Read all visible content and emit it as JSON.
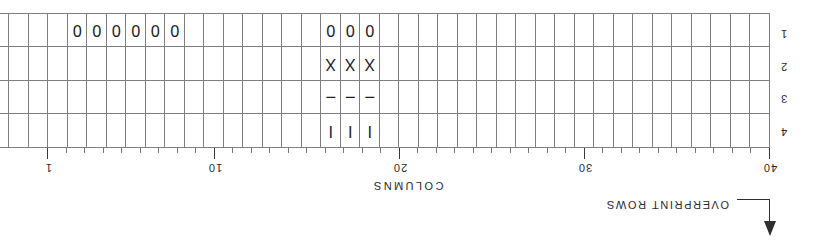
{
  "figure": {
    "orientation": "rotated-180",
    "columns_caption": "COLUMNS",
    "overprint_label": "OVERPRINT ROWS"
  },
  "grid": {
    "num_columns": 40,
    "num_rows": 4,
    "column_numbering_direction": "right-to-left",
    "row_labels": [
      "4",
      "3",
      "2",
      "1"
    ],
    "tick_labels": [
      {
        "value": "40",
        "column": 40
      },
      {
        "value": "30",
        "column": 30
      },
      {
        "value": "20",
        "column": 20
      },
      {
        "value": "10",
        "column": 10
      },
      {
        "value": "1",
        "column": 1
      }
    ],
    "marks": [
      {
        "row": 4,
        "column": 20,
        "char": "I"
      },
      {
        "row": 4,
        "column": 19,
        "char": "I"
      },
      {
        "row": 4,
        "column": 18,
        "char": "I"
      },
      {
        "row": 3,
        "column": 20,
        "char": "–"
      },
      {
        "row": 3,
        "column": 19,
        "char": "–"
      },
      {
        "row": 3,
        "column": 18,
        "char": "–"
      },
      {
        "row": 2,
        "column": 20,
        "char": "X"
      },
      {
        "row": 2,
        "column": 19,
        "char": "X"
      },
      {
        "row": 2,
        "column": 18,
        "char": "X"
      },
      {
        "row": 1,
        "column": 20,
        "char": "0"
      },
      {
        "row": 1,
        "column": 19,
        "char": "0"
      },
      {
        "row": 1,
        "column": 18,
        "char": "0"
      },
      {
        "row": 1,
        "column": 10,
        "char": "0"
      },
      {
        "row": 1,
        "column": 9,
        "char": "0"
      },
      {
        "row": 1,
        "column": 8,
        "char": "0"
      },
      {
        "row": 1,
        "column": 7,
        "char": "0"
      },
      {
        "row": 1,
        "column": 6,
        "char": "0"
      },
      {
        "row": 1,
        "column": 5,
        "char": "0"
      }
    ]
  }
}
